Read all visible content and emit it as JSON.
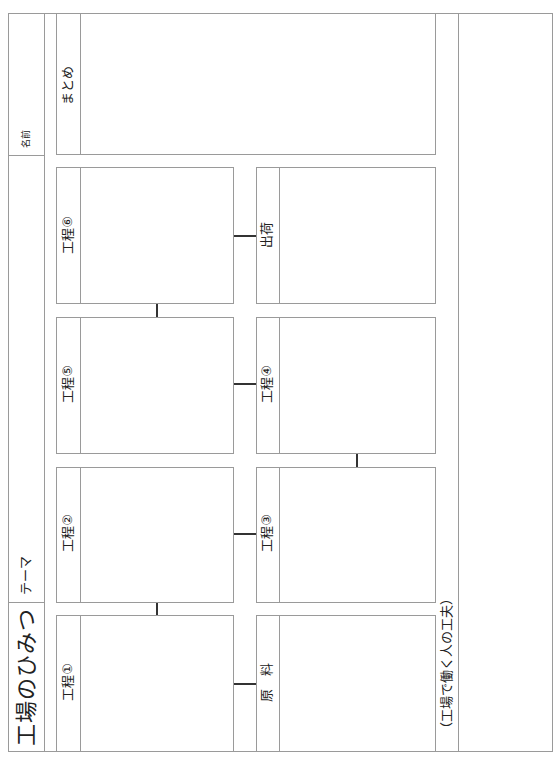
{
  "header": {
    "title": "工場のひみつ",
    "theme_label": "テーマ",
    "name_label": "名前"
  },
  "summary": {
    "label": "まとめ"
  },
  "boxes": {
    "p1": "工程①",
    "p2": "工程②",
    "p3": "工程③",
    "p4": "工程④",
    "p5": "工程⑤",
    "p6": "工程⑥",
    "raw": "原　料",
    "ship": "出荷"
  },
  "footer": {
    "label": "（工場で働く人の工夫）"
  }
}
